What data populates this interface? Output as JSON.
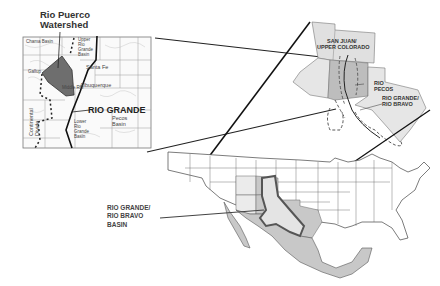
{
  "map": {
    "inset_nm": {
      "title_line1": "Rio Puerco",
      "title_line2": "Watershed",
      "river_label": "RIO GRANDE",
      "places": {
        "upper_left": "Chama Basin",
        "upper_right_1": "Upper",
        "upper_right_2": "Rio",
        "upper_right_3": "Grande",
        "upper_right_4": "Basin",
        "santa_fe": "Santa Fe",
        "albuquerque": "Albuquerque",
        "middle_rg": "Middle Rio",
        "west": "Gallup",
        "pecos_1": "Pecos",
        "pecos_2": "Basin",
        "lower_1": "Lower",
        "lower_2": "Rio",
        "lower_3": "Grande",
        "lower_4": "Basin",
        "continental_divide_1": "Continental",
        "continental_divide_2": "Divide"
      }
    },
    "inset_region": {
      "label_san_juan_1": "SAN JUAN/",
      "label_san_juan_2": "UPPER COLORADO",
      "label_pecos_1": "RIO",
      "label_pecos_2": "PECOS",
      "label_rg_1": "RIO GRANDE/",
      "label_rg_2": "RIO BRAVO"
    },
    "main": {
      "basin_label_1": "RIO GRANDE/",
      "basin_label_2": "RIO BRAVO",
      "basin_label_3": "BASIN"
    }
  },
  "colors": {
    "light_gray": "#e6e6e6",
    "mid_gray": "#c8c8c8",
    "watershed": "#6e6e6e",
    "line": "#222222"
  }
}
